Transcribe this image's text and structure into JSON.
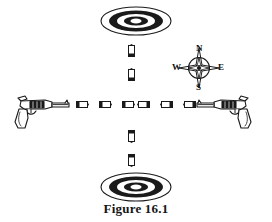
{
  "figure": {
    "caption": "Figure 16.1",
    "ink_color": "#1a1a1a",
    "background_color": "#ffffff"
  },
  "compass": {
    "name": "compass-rose",
    "north_label": "N",
    "south_label": "S",
    "west_label": "W",
    "east_label": "E"
  },
  "targets": [
    {
      "name": "target-top",
      "position": "top",
      "left": 100,
      "top": 6,
      "rings": 5
    },
    {
      "name": "target-bottom",
      "position": "bottom",
      "left": 100,
      "top": 172,
      "rings": 5
    }
  ],
  "pistols": [
    {
      "name": "pistol-left",
      "facing": "east",
      "left": 12,
      "top": 88
    },
    {
      "name": "pistol-right",
      "facing": "west",
      "left": 192,
      "top": 88
    }
  ],
  "bullets_horizontal": [
    {
      "name": "bullet-h-1",
      "left": 76,
      "top": 101,
      "facing": "east"
    },
    {
      "name": "bullet-h-2",
      "left": 99,
      "top": 101,
      "facing": "east"
    },
    {
      "name": "bullet-h-3",
      "left": 122,
      "top": 101,
      "facing": "east"
    },
    {
      "name": "bullet-h-4",
      "left": 137,
      "top": 101,
      "facing": "west"
    },
    {
      "name": "bullet-h-5",
      "left": 160,
      "top": 101,
      "facing": "west"
    },
    {
      "name": "bullet-h-6",
      "left": 183,
      "top": 101,
      "facing": "west"
    }
  ],
  "bullets_vertical": [
    {
      "name": "bullet-v-1",
      "left": 128,
      "top": 44,
      "facing": "north"
    },
    {
      "name": "bullet-v-2",
      "left": 128,
      "top": 68,
      "facing": "north"
    },
    {
      "name": "bullet-v-3",
      "left": 128,
      "top": 130,
      "facing": "south"
    },
    {
      "name": "bullet-v-4",
      "left": 128,
      "top": 154,
      "facing": "south"
    }
  ]
}
